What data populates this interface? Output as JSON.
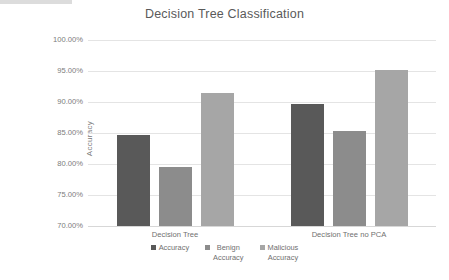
{
  "chart_data": {
    "type": "bar",
    "title": "Decision Tree Classification",
    "xlabel": "",
    "ylabel": "Accuracy",
    "categories": [
      "Decision Tree",
      "Decision Tree no PCA"
    ],
    "series": [
      {
        "name": "Accuracy",
        "values": [
          84.7,
          89.7
        ],
        "color": "#595959"
      },
      {
        "name": "Benign Accuracy",
        "values": [
          79.5,
          85.3
        ],
        "color": "#8c8c8c"
      },
      {
        "name": "Malicious Accuracy",
        "values": [
          91.5,
          95.2
        ],
        "color": "#a6a6a6"
      }
    ],
    "ylim": [
      70,
      100
    ],
    "ytick_values": [
      100,
      95,
      90,
      85,
      80,
      75,
      70
    ],
    "ytick_labels": [
      "100.00%",
      "95.00%",
      "90.00%",
      "85.00%",
      "80.00%",
      "75.00%",
      "70.00%"
    ],
    "grid": true,
    "legend_position": "bottom",
    "legend_entries": [
      {
        "label_line1": "Accuracy",
        "label_line2": ""
      },
      {
        "label_line1": "Benign",
        "label_line2": "Accuracy"
      },
      {
        "label_line1": "Malicious",
        "label_line2": "Accuracy"
      }
    ]
  }
}
